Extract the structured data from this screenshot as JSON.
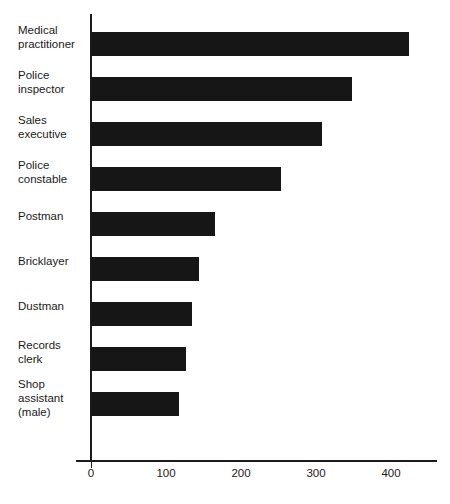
{
  "chart_data": {
    "type": "bar",
    "orientation": "horizontal",
    "title": "",
    "subtitle": "",
    "xlabel": "",
    "ylabel": "",
    "categories": [
      "Medical practitioner",
      "Police inspector",
      "Sales executive",
      "Police constable",
      "Postman",
      "Bricklayer",
      "Dustman",
      "Records clerk",
      "Shop assistant (male)"
    ],
    "values": [
      424,
      348,
      308,
      253,
      165,
      144,
      135,
      127,
      117
    ],
    "xlim": [
      0,
      460
    ],
    "xticks": [
      0,
      100,
      200,
      300,
      400
    ],
    "xticklabels": [
      "0",
      "100",
      "200",
      "300",
      "400"
    ],
    "grid": false,
    "legend": null,
    "bar_color": "#161616",
    "axis_color": "#1c1c1c",
    "background_color": "#ffffff"
  },
  "labels": {
    "lines": [
      [
        "Medical",
        "practitioner"
      ],
      [
        "Police",
        "inspector"
      ],
      [
        "Sales",
        "executive"
      ],
      [
        "Police",
        "constable"
      ],
      [
        "Postman"
      ],
      [
        "Bricklayer"
      ],
      [
        "Dustman"
      ],
      [
        "Records",
        "clerk"
      ],
      [
        "Shop",
        "assistant",
        "(male)"
      ]
    ]
  }
}
